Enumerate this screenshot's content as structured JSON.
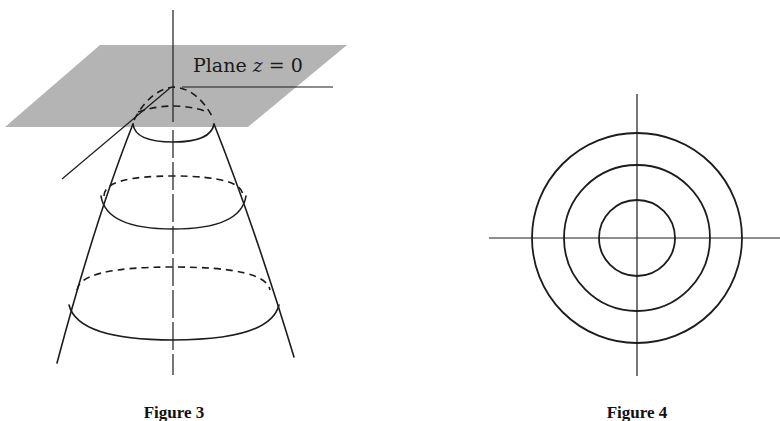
{
  "figures": {
    "figure3": {
      "caption": "Figure 3",
      "plane_label_prefix": "Plane ",
      "plane_label_var": "z",
      "plane_label_suffix": " = 0",
      "plane_color": "#b4b4b4",
      "description": "Paraboloid opening downward with apex touching the plane z=0, with horizontal cross-section ellipses"
    },
    "figure4": {
      "caption": "Figure 4",
      "description": "Level curves: three concentric circles centered at origin with coordinate axes",
      "circle_count": 3
    }
  },
  "colors": {
    "ink": "#1c1c1c",
    "plane": "#b4b4b4",
    "background": "#ffffff"
  }
}
